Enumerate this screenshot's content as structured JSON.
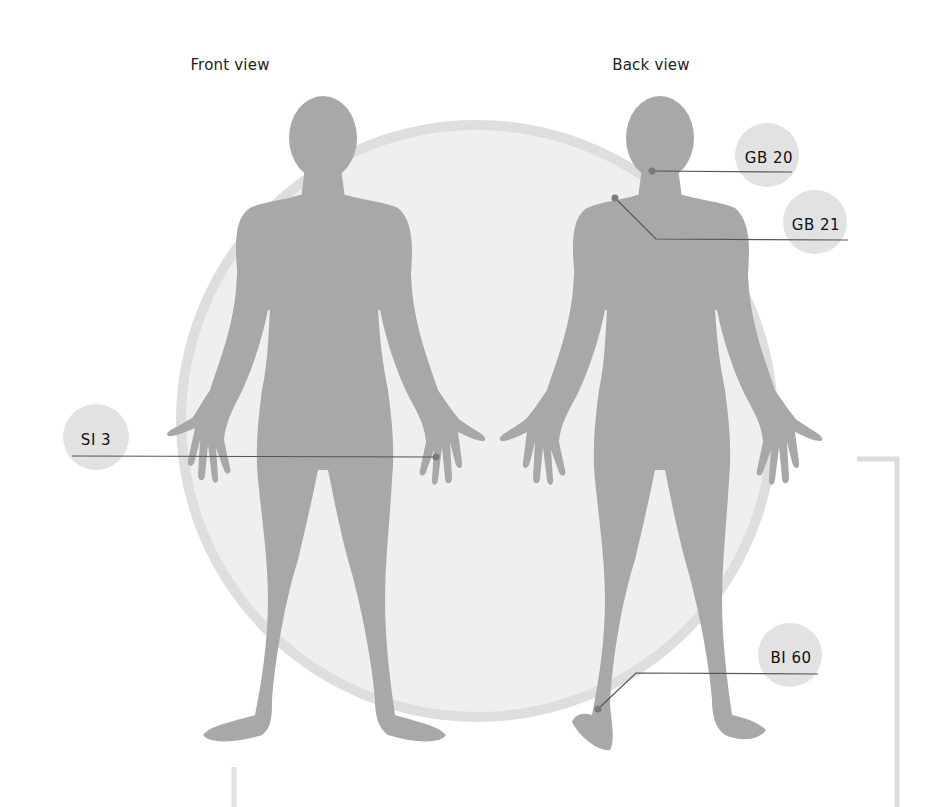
{
  "views": {
    "front": {
      "title": "Front view"
    },
    "back": {
      "title": "Back view"
    }
  },
  "points": [
    {
      "id": "si3",
      "label": "SI 3",
      "view": "front",
      "location": "hand"
    },
    {
      "id": "gb20",
      "label": "GB 20",
      "view": "back",
      "location": "neck"
    },
    {
      "id": "gb21",
      "label": "GB 21",
      "view": "back",
      "location": "shoulder"
    },
    {
      "id": "bi60",
      "label": "BI 60",
      "view": "back",
      "location": "ankle"
    }
  ],
  "colors": {
    "figure": "#a8a8a8",
    "background_circle_fill": "#efefef",
    "background_circle_ring": "#dedede",
    "label_circle": "#e2e2e2",
    "leader_line": "#555555",
    "point_dot": "#7a7a7a",
    "bracket": "#dcdcdc"
  }
}
